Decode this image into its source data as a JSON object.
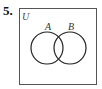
{
  "problem": {
    "number": "5.",
    "universe_label": "U",
    "sets": [
      {
        "label": "A"
      },
      {
        "label": "B"
      }
    ]
  }
}
